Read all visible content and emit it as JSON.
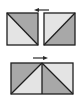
{
  "diagram": {
    "title": "",
    "colors": {
      "dark_triangle": "#a8a8a8",
      "light_triangle": "#e4e4e4",
      "outline": "#1e1e1e",
      "arrow": "#2a2a2a",
      "background": "#ffffff"
    },
    "top_row": {
      "arrow_direction": "left",
      "squares": [
        {
          "id": "square-a",
          "diagonal": "top-left to bottom-right",
          "dark_region": "upper-right",
          "light_region": "lower-left"
        },
        {
          "id": "square-b",
          "diagonal": "bottom-left to top-right",
          "dark_region": "lower-right",
          "light_region": "upper-left"
        }
      ]
    },
    "bottom_row": {
      "arrow_direction": "right",
      "shape": "rectangle formed by two joined squares",
      "halves": [
        {
          "id": "half-left",
          "diagonal": "bottom-left to top-right",
          "dark_region": "upper-left",
          "light_region": "lower-right"
        },
        {
          "id": "half-right",
          "diagonal": "top-left to bottom-right",
          "dark_region": "lower-left",
          "light_region": "upper-right"
        }
      ]
    }
  }
}
